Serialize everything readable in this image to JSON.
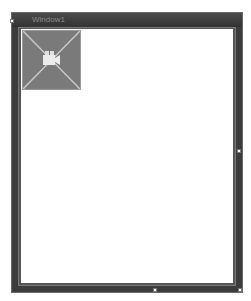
{
  "window": {
    "title": "Window1",
    "colors": {
      "frame": "#3c3c3c",
      "title_text": "#8a8a8a",
      "content_bg": "#ffffff",
      "placeholder_bg": "#7a7a7a"
    }
  },
  "content": {
    "image_placeholder": {
      "icon": "video-camera-icon"
    }
  },
  "handles": [
    "top-left",
    "right-middle",
    "bottom-middle",
    "bottom-right"
  ]
}
